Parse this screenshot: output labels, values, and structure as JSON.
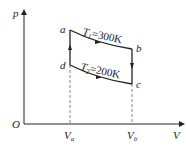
{
  "diagram": {
    "type": "p-V diagram (Carnot cycle)",
    "axes": {
      "y_label": "p",
      "x_label": "V",
      "origin_label": "O"
    },
    "points": {
      "a": "a",
      "b": "b",
      "c": "c",
      "d": "d"
    },
    "ticks": {
      "va": "V",
      "va_sub": "a",
      "vb": "V",
      "vb_sub": "b"
    },
    "isotherms": {
      "upper": {
        "T": "T",
        "sub": "1",
        "value": "=300K"
      },
      "lower": {
        "T": "T",
        "sub": "2",
        "value": "=200K"
      }
    },
    "colors": {
      "line": "#222222",
      "dashed": "#666666"
    }
  }
}
